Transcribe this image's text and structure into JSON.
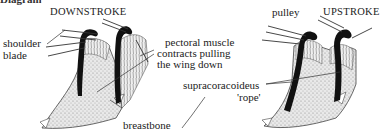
{
  "figure": {
    "cropped_header": "Diagram",
    "panels": [
      {
        "id": "downstroke",
        "title": "DOWNSTROKE"
      },
      {
        "id": "upstroke",
        "title": "UPSTROKE"
      }
    ],
    "labels": {
      "shoulder_blade_1": "shoulder",
      "shoulder_blade_2": "blade",
      "pectoral_1": "pectoral muscle",
      "pectoral_2": "contracts pulling",
      "pectoral_3": "the wing down",
      "breastbone": "breastbone",
      "pulley": "pulley",
      "supracoracoideus_1": "supracoracoideus",
      "supracoracoideus_2": "'rope'"
    },
    "colors": {
      "ink": "#111111",
      "stipple": "#bdbdbd",
      "background": "#ffffff"
    }
  }
}
